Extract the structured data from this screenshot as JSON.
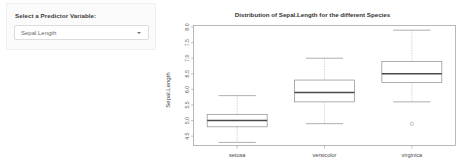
{
  "sidebar": {
    "label": "Select a Predictor Variable:",
    "select": {
      "value": "Sepal.Length",
      "placeholder": "Sepal.Length",
      "caret_icon": "chevron-down-icon",
      "options": [
        "Sepal.Length",
        "Sepal.Width",
        "Petal.Length",
        "Petal.Width"
      ]
    }
  },
  "chart_data": {
    "type": "box",
    "title": "Distribution of Sepal.Length for the different Species",
    "xlabel": "",
    "ylabel": "Sepal.Length",
    "categories": [
      "setosa",
      "versicolor",
      "virginica"
    ],
    "ylim": [
      4.2,
      8.05
    ],
    "yticks": [
      4.5,
      5.0,
      5.5,
      6.0,
      6.5,
      7.0,
      7.5,
      8.0
    ],
    "ytick_labels": [
      "4.5",
      "5.0",
      "5.5",
      "6.0",
      "6.5",
      "7.0",
      "7.5",
      "8.0"
    ],
    "grid": false,
    "legend": "none",
    "series": [
      {
        "name": "setosa",
        "min": 4.3,
        "q1": 4.8,
        "median": 5.0,
        "q3": 5.2,
        "max": 5.8,
        "outliers": []
      },
      {
        "name": "versicolor",
        "min": 4.9,
        "q1": 5.6,
        "median": 5.9,
        "q3": 6.3,
        "max": 7.0,
        "outliers": []
      },
      {
        "name": "virginica",
        "min": 5.6,
        "q1": 6.225,
        "median": 6.5,
        "q3": 6.9,
        "max": 7.9,
        "outliers": [
          4.9
        ]
      }
    ],
    "colors": {
      "box_fill": "#ffffff",
      "box_stroke": "#8c8c8c",
      "median": "#4a4a4a",
      "whisker": "#b9b9b9",
      "frame": "#9a9a9a"
    }
  }
}
